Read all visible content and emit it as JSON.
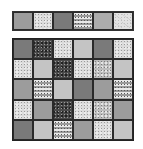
{
  "game": {
    "type": "tile-matching puzzle",
    "columns": 6,
    "rows": 5
  },
  "target_strip": {
    "tiles": [
      "s-mid",
      "t-lightspeckle",
      "s-dark",
      "t-dots",
      "s-midlight",
      "t-marble"
    ]
  },
  "board": {
    "rows": [
      [
        "s-dark",
        "t-granite",
        "t-lightspeckle",
        "s-light",
        "s-dark",
        "t-lightspeckle"
      ],
      [
        "t-lightspeckle",
        "s-light",
        "t-granite",
        "t-lightspeckle",
        "t-medspeckle",
        "s-light"
      ],
      [
        "s-mid",
        "t-dots",
        "s-light",
        "s-dark",
        "s-mid",
        "t-dots"
      ],
      [
        "t-lightspeckle",
        "s-mid",
        "t-granite",
        "t-lightspeckle",
        "t-medspeckle",
        "s-mid"
      ],
      [
        "s-dark",
        "s-light",
        "t-dots",
        "s-mid",
        "t-lightspeckle",
        "s-light"
      ]
    ]
  },
  "colors": {
    "border": "#2a2a2a",
    "background": "#ffffff"
  }
}
